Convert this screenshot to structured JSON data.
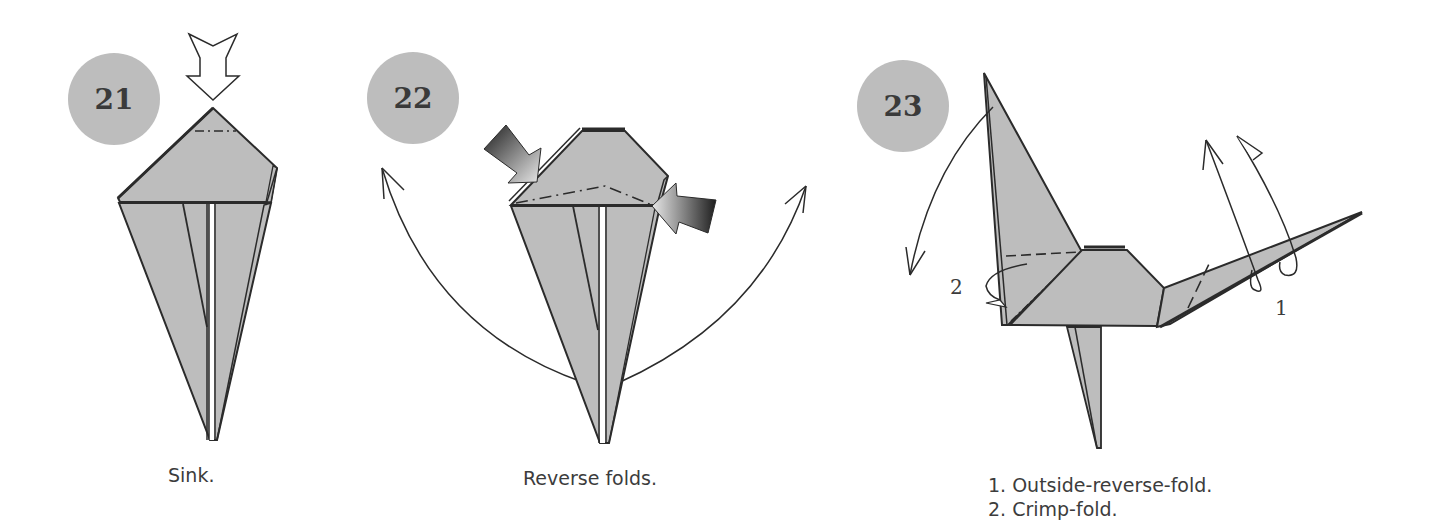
{
  "steps": [
    {
      "number": "21",
      "caption": "Sink."
    },
    {
      "number": "22",
      "caption": "Reverse folds."
    },
    {
      "number": "23",
      "captions": [
        "1. Outside-reverse-fold.",
        "2. Crimp-fold."
      ],
      "labels": [
        "1",
        "2"
      ]
    }
  ],
  "colors": {
    "paper": "#bdbdbd",
    "badge": "#bdbdbd",
    "line": "#2b2b2b",
    "text": "#3c3c3c"
  }
}
